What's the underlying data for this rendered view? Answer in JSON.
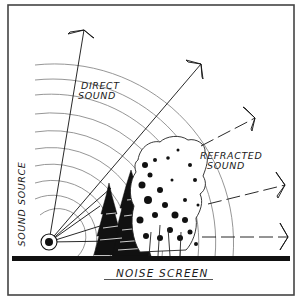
{
  "diagram": {
    "labels": {
      "direct_sound": [
        "DIRECT",
        "SOUND"
      ],
      "refracted_sound": [
        "REFRACTED",
        "SOUND"
      ],
      "sound_source": "SOUND SOURCE",
      "noise_screen": "NOISE SCREEN"
    },
    "elements": {
      "sound_source": {
        "cx": 49,
        "cy": 242
      },
      "wavefront_arc_count": 10,
      "direct_rays": 2,
      "refracted_rays": 3,
      "ground": "solid black bar",
      "vegetation": [
        "evergreen conifers",
        "deciduous tree"
      ]
    },
    "colors": {
      "ink": "#111111",
      "arc": "#8a8a8a",
      "frame": "#444444",
      "background": "#ffffff"
    }
  }
}
